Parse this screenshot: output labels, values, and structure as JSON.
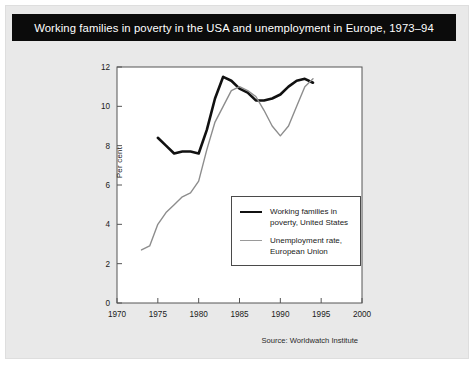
{
  "figure": {
    "title": "Working families in poverty in the USA and unemployment in Europe, 1973–94",
    "source": "Source: Worldwatch Institute",
    "title_bar_color": "#0b0b0b",
    "title_text_color": "#ffffff",
    "background_color": "#e9e9e9",
    "plot_background_color": "#ffffff"
  },
  "chart_data": {
    "type": "line",
    "title": "Working families in poverty in the USA and unemployment in Europe, 1973–94",
    "xlabel": "",
    "ylabel": "Per cent",
    "xlim": [
      1970,
      2000
    ],
    "ylim": [
      0,
      12
    ],
    "xticks": [
      1970,
      1975,
      1980,
      1985,
      1990,
      1995,
      2000
    ],
    "xtick_labels": [
      "1970",
      "1975",
      "1980",
      "1985",
      "1990",
      "1995",
      "2000"
    ],
    "yticks": [
      0,
      2,
      4,
      6,
      8,
      10,
      12
    ],
    "ytick_labels": [
      "0",
      "2",
      "4",
      "6",
      "8",
      "10",
      "12"
    ],
    "grid": false,
    "legend_position": "center-right-inside",
    "series": [
      {
        "name": "Working families in\npoverty, United States",
        "legend_label_line1": "Working families in",
        "legend_label_line2": "poverty, United States",
        "color": "#111111",
        "width": 2.6,
        "x": [
          1975,
          1976,
          1977,
          1978,
          1979,
          1980,
          1981,
          1982,
          1983,
          1984,
          1985,
          1986,
          1987,
          1988,
          1989,
          1990,
          1991,
          1992,
          1993,
          1994
        ],
        "y": [
          8.4,
          8.0,
          7.6,
          7.7,
          7.7,
          7.6,
          8.8,
          10.4,
          11.5,
          11.3,
          10.9,
          10.7,
          10.3,
          10.3,
          10.4,
          10.6,
          11.0,
          11.3,
          11.4,
          11.2
        ]
      },
      {
        "name": "Unemployment rate,\nEuropean Union",
        "legend_label_line1": "Unemployment rate,",
        "legend_label_line2": "European Union",
        "color": "#8d8d8d",
        "width": 1.4,
        "x": [
          1973,
          1974,
          1975,
          1976,
          1977,
          1978,
          1979,
          1980,
          1981,
          1982,
          1983,
          1984,
          1985,
          1986,
          1987,
          1988,
          1989,
          1990,
          1991,
          1992,
          1993,
          1994
        ],
        "y": [
          2.7,
          2.9,
          4.0,
          4.6,
          5.0,
          5.4,
          5.6,
          6.2,
          7.8,
          9.2,
          10.0,
          10.8,
          11.0,
          10.8,
          10.5,
          9.8,
          9.0,
          8.5,
          9.0,
          10.0,
          11.0,
          11.4
        ]
      }
    ]
  }
}
